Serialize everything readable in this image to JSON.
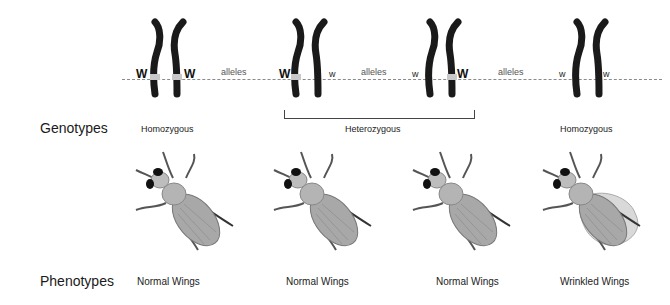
{
  "rows": {
    "genotypes_label": "Genotypes",
    "phenotypes_label": "Phenotypes"
  },
  "pairs": [
    {
      "left_allele": "W",
      "right_allele": "W",
      "genotype": "Homozygous",
      "phenotype": "Normal Wings"
    },
    {
      "left_allele": "W",
      "right_allele": "w",
      "genotype": "Heterozygous",
      "phenotype": "Normal Wings"
    },
    {
      "left_allele": "w",
      "right_allele": "W",
      "genotype": "Heterozygous",
      "phenotype": "Normal Wings"
    },
    {
      "left_allele": "w",
      "right_allele": "w",
      "genotype": "Homozygous",
      "phenotype": "Wrinkled Wings"
    }
  ],
  "connectors": [
    "alleles",
    "alleles",
    "alleles"
  ],
  "heterozygous_group_label": "Heterozygous",
  "colors": {
    "chromosome": "#1a1a1a",
    "dominant_band": "#c8c8c8",
    "dashed_line": "#8a8a8a",
    "fly_body": "#9a9a9a",
    "wrinkled_wing": "#d9d9d9"
  }
}
